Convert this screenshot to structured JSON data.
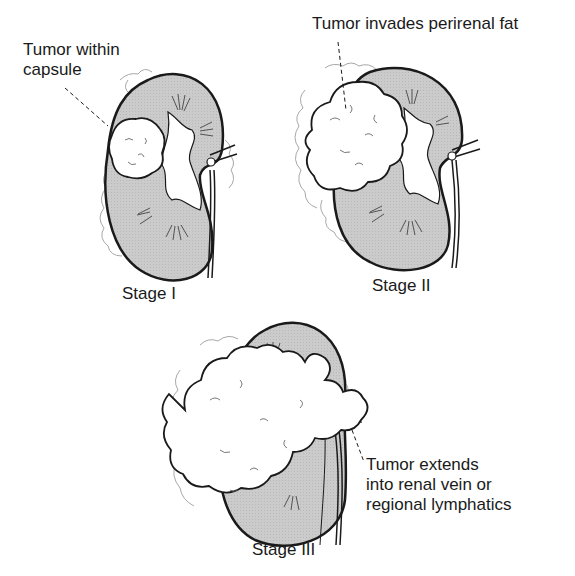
{
  "figure": {
    "panels": [
      {
        "id": "stage-1",
        "stage_label": "Stage I",
        "annotation_lines": [
          "Tumor within",
          "capsule"
        ]
      },
      {
        "id": "stage-2",
        "stage_label": "Stage II",
        "annotation_lines": [
          "Tumor invades perirenal fat"
        ]
      },
      {
        "id": "stage-3",
        "stage_label": "Stage III",
        "annotation_lines": [
          "Tumor extends",
          "into renal vein or",
          "regional lymphatics"
        ]
      }
    ],
    "colors": {
      "kidney_fill": "#c9c9c9",
      "outline": "#1a1a1a",
      "tumor_fill": "#ffffff",
      "fat_stroke": "#9a9a9a"
    }
  }
}
